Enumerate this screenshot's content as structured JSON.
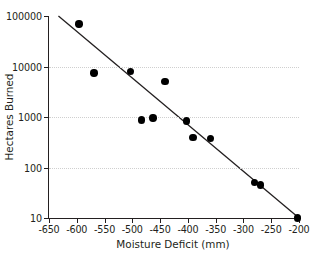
{
  "chart_data": {
    "type": "scatter",
    "title": "",
    "xlabel": "Moisture Deficit (mm)",
    "ylabel": "Hectares Burned",
    "xlim": [
      -650,
      -200
    ],
    "ylim": [
      10,
      100000
    ],
    "yscale": "log",
    "xscale": "linear",
    "grid": true,
    "legend": null,
    "xticks": [
      -650,
      -600,
      -550,
      -500,
      -450,
      -400,
      -350,
      -300,
      -250,
      -200
    ],
    "xticklabels": [
      "-650",
      "-600",
      "-550",
      "-500",
      "-450",
      "-400",
      "-350",
      "-300",
      "-250",
      "-200"
    ],
    "yticks": [
      10,
      100,
      1000,
      10000,
      100000
    ],
    "yticklabels": [
      "10",
      "100",
      "1000",
      "10000",
      "100000"
    ],
    "marker": "filled-circle",
    "marker_color": "#000000",
    "points": [
      {
        "x": -596,
        "y": 70000
      },
      {
        "x": -569,
        "y": 7500
      },
      {
        "x": -503,
        "y": 7900
      },
      {
        "x": -483,
        "y": 880
      },
      {
        "x": -463,
        "y": 950
      },
      {
        "x": -441,
        "y": 5000
      },
      {
        "x": -402,
        "y": 830
      },
      {
        "x": -391,
        "y": 390
      },
      {
        "x": -359,
        "y": 380
      },
      {
        "x": -280,
        "y": 50
      },
      {
        "x": -269,
        "y": 45
      },
      {
        "x": -203,
        "y": 10
      }
    ],
    "trendline": {
      "type": "linear-on-log",
      "color": "#231f20",
      "x_start": -633,
      "y_start": 100000,
      "x_end": -200,
      "y_end": 10
    }
  }
}
